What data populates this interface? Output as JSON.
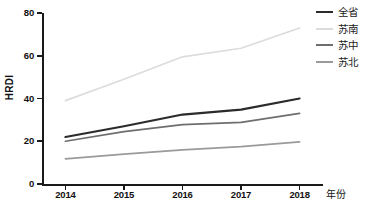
{
  "chart_data": {
    "type": "line",
    "title": "",
    "xlabel": "年份",
    "ylabel": "HRDI",
    "categories": [
      "2014",
      "2015",
      "2016",
      "2017",
      "2018"
    ],
    "x": [
      2014,
      2015,
      2016,
      2017,
      2018
    ],
    "xlim": [
      2013.6,
      2018.4
    ],
    "ylim": [
      0,
      80
    ],
    "yticks": [
      0,
      20,
      40,
      60,
      80
    ],
    "xticks": [
      "2014",
      "2015",
      "2016",
      "2017",
      "2018"
    ],
    "grid": false,
    "legend_position": "right-top",
    "series": [
      {
        "name": "全省",
        "color": "#2b2b2b",
        "width": 2.2,
        "values": [
          22.0,
          27.0,
          32.5,
          34.8,
          40.0
        ]
      },
      {
        "name": "苏南",
        "color": "#dcdcdc",
        "width": 1.7,
        "values": [
          39.0,
          49.0,
          59.5,
          63.5,
          73.0
        ]
      },
      {
        "name": "苏中",
        "color": "#6e6e6e",
        "width": 1.7,
        "values": [
          20.0,
          24.5,
          27.8,
          28.8,
          33.0
        ]
      },
      {
        "name": "苏北",
        "color": "#9a9a9a",
        "width": 1.7,
        "values": [
          11.8,
          14.0,
          16.0,
          17.5,
          19.7
        ]
      }
    ]
  },
  "legend": {
    "items": [
      {
        "label": "全省"
      },
      {
        "label": "苏南"
      },
      {
        "label": "苏中"
      },
      {
        "label": "苏北"
      }
    ]
  },
  "axis": {
    "y_label": "HRDI",
    "x_label": "年份",
    "y_tick_labels": [
      "0",
      "20",
      "40",
      "60",
      "80"
    ],
    "x_tick_labels": [
      "2014",
      "2015",
      "2016",
      "2017",
      "2018"
    ]
  },
  "colors": {
    "axis": "#1a1a1a",
    "background": "#ffffff",
    "series_quansheng": "#2b2b2b",
    "series_sunan": "#dcdcdc",
    "series_suzhong": "#6e6e6e",
    "series_subei": "#9a9a9a"
  }
}
